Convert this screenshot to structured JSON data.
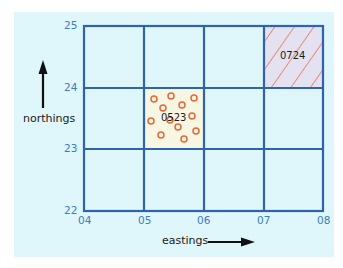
{
  "diagram": {
    "type": "grid-reference",
    "x_axis": {
      "label": "eastings",
      "ticks": [
        "04",
        "05",
        "06",
        "07",
        "08"
      ]
    },
    "y_axis": {
      "label": "northings",
      "ticks": [
        "25",
        "24",
        "23",
        "22"
      ]
    },
    "squares": [
      {
        "ref": "0523",
        "pattern": "circles",
        "fill": "#f7f6e2",
        "marker_color": "#e06a3a"
      },
      {
        "ref": "0724",
        "pattern": "diagonal-hatch",
        "fill": "#e4e2f1",
        "marker_color": "#e06a3a"
      }
    ],
    "colors": {
      "background": "#dff6fa",
      "grid": "#2f64ad",
      "tick_labels": "#3a7ec0",
      "arrow": "#111111"
    }
  }
}
